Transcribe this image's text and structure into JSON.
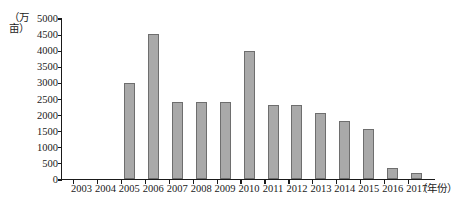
{
  "chart_data": {
    "type": "bar",
    "title": "",
    "subtitle": "",
    "xlabel": "（年份）",
    "ylabel": "（万亩）",
    "categories": [
      "2003",
      "2004",
      "2005",
      "2006",
      "2007",
      "2008",
      "2009",
      "2010",
      "2011",
      "2012",
      "2013",
      "2014",
      "2015",
      "2016",
      "2017"
    ],
    "values": [
      0,
      0,
      3000,
      4500,
      2400,
      2400,
      2400,
      4000,
      2300,
      2300,
      2050,
      1800,
      1550,
      350,
      200
    ],
    "ylim": [
      0,
      5000
    ],
    "ytick_values": [
      0,
      500,
      1000,
      1500,
      2000,
      2500,
      3000,
      3500,
      4000,
      4500,
      5000
    ],
    "ytick_labels": [
      "0",
      "500",
      "1000",
      "1500",
      "2000",
      "2500",
      "3000",
      "3500",
      "4000",
      "4500",
      "5000"
    ],
    "grid": false,
    "legend": null,
    "legend_position": "none",
    "series": [
      {
        "name": "",
        "values": [
          0,
          0,
          3000,
          4500,
          2400,
          2400,
          2400,
          4000,
          2300,
          2300,
          2050,
          1800,
          1550,
          350,
          200
        ]
      }
    ],
    "colors": {
      "bar_fill": "#a9a9a9",
      "bar_border": "#6e6e6e",
      "axis": "#1a1a1a",
      "text": "#1a1a1a",
      "background": "#ffffff"
    }
  }
}
